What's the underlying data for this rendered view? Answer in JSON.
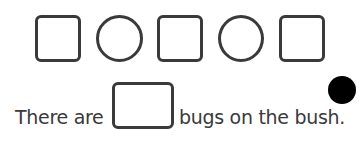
{
  "pattern": {
    "shapes": [
      {
        "type": "square"
      },
      {
        "type": "circle"
      },
      {
        "type": "square"
      },
      {
        "type": "circle"
      },
      {
        "type": "square"
      }
    ]
  },
  "sentence": {
    "before": "There are",
    "after": "bugs on the bush."
  },
  "answer_box": {
    "value": ""
  },
  "marker": {
    "color": "#000000"
  }
}
